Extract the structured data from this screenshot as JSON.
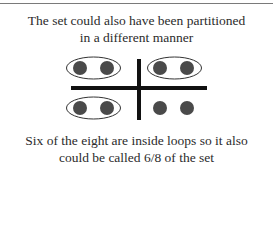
{
  "header": {
    "line1": "The set could also have been partitioned",
    "line2": "in a different manner"
  },
  "footer": {
    "line1": "Six of the eight are inside loops so it also",
    "line2": "could be called 6/8 of the set"
  },
  "diagram": {
    "dot_color": "#4a4a4a",
    "bar_color": "#111111",
    "loop_color": "#333333",
    "total_dots": 8,
    "dots_in_loops": 6,
    "fraction_label": "6/8",
    "dots": [
      {
        "x": 80,
        "y": 68,
        "looped": true
      },
      {
        "x": 107,
        "y": 68,
        "looped": true
      },
      {
        "x": 160,
        "y": 68,
        "looped": true
      },
      {
        "x": 187,
        "y": 68,
        "looped": true
      },
      {
        "x": 80,
        "y": 108,
        "looped": true
      },
      {
        "x": 107,
        "y": 108,
        "looped": true
      },
      {
        "x": 160,
        "y": 108,
        "looped": false
      },
      {
        "x": 187,
        "y": 108,
        "looped": false
      }
    ],
    "loops": [
      {
        "cx": 93.5,
        "cy": 68,
        "rx": 27,
        "ry": 11
      },
      {
        "cx": 174.5,
        "cy": 68,
        "rx": 27,
        "ry": 11
      },
      {
        "cx": 93.5,
        "cy": 108,
        "rx": 27,
        "ry": 11
      }
    ]
  }
}
